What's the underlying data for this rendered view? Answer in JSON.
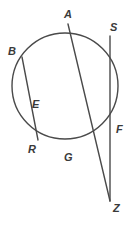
{
  "figure": {
    "type": "geometry-diagram",
    "width": 135,
    "height": 228,
    "background_color": "#ffffff",
    "stroke_color": "#4a4a4a",
    "label_color": "#3a3a3a",
    "stroke_width": 1.4
  },
  "circle": {
    "name": "main-circle",
    "center_x": 65,
    "center_y": 86,
    "radius": 53
  },
  "points": [
    {
      "id": "A",
      "label": "A",
      "x": 68,
      "y": 24,
      "label_x": 64,
      "label_y": 9,
      "on_circle": true
    },
    {
      "id": "B",
      "label": "B",
      "x": 22,
      "y": 57,
      "label_x": 8,
      "label_y": 46,
      "on_circle": true
    },
    {
      "id": "S",
      "label": "S",
      "x": 110,
      "y": 36,
      "label_x": 110,
      "label_y": 22,
      "on_circle": true
    },
    {
      "id": "E",
      "label": "E",
      "x": 48,
      "y": 108,
      "label_x": 32,
      "label_y": 99,
      "on_circle": false
    },
    {
      "id": "F",
      "label": "F",
      "x": 111,
      "y": 131,
      "label_x": 116,
      "label_y": 124,
      "on_circle": true
    },
    {
      "id": "R",
      "label": "R",
      "x": 38,
      "y": 140,
      "label_x": 28,
      "label_y": 144,
      "on_circle": true
    },
    {
      "id": "G",
      "label": "G",
      "x": 70,
      "y": 148,
      "label_x": 64,
      "label_y": 152,
      "on_circle": true
    },
    {
      "id": "Z",
      "label": "Z",
      "x": 110,
      "y": 201,
      "label_x": 113,
      "label_y": 203,
      "on_circle": false
    }
  ],
  "segments": [
    {
      "id": "AZ",
      "name": "secant-a-to-z",
      "from": "A",
      "to": "Z",
      "passes_through": [
        "E",
        "G"
      ]
    },
    {
      "id": "BR",
      "name": "chord-b-to-r",
      "from": "B",
      "to": "R",
      "passes_through": [
        "E"
      ]
    },
    {
      "id": "SZ",
      "name": "secant-s-to-z",
      "from": "S",
      "to": "Z",
      "passes_through": [
        "F"
      ]
    }
  ]
}
